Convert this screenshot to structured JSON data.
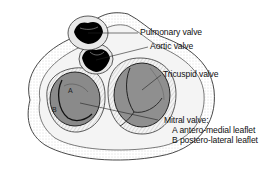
{
  "diagram": {
    "labels": {
      "pulmonary": "Pulmonary valve",
      "aortic": "Aortic valve",
      "tricuspid": "Tricuspid valve",
      "mitral": "Mitral valve:",
      "mitral_a": "A antero-medial leaflet",
      "mitral_b": "B postero-lateral leaflet"
    },
    "leaflet_markers": {
      "a": "A",
      "b": "B"
    }
  }
}
